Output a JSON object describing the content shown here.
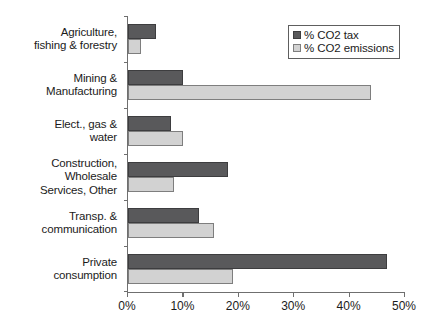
{
  "chart_data": {
    "type": "bar",
    "orientation": "horizontal",
    "title": "",
    "xlabel": "",
    "ylabel": "",
    "xlim": [
      0,
      50
    ],
    "xticks": [
      0,
      10,
      20,
      30,
      40,
      50
    ],
    "xtick_labels": [
      "0%",
      "10%",
      "20%",
      "30%",
      "40%",
      "50%"
    ],
    "grid": false,
    "legend_position": "top-right",
    "categories": [
      "Agriculture,\nfishing & forestry",
      "Mining &\nManufacturing",
      "Elect., gas &\nwater",
      "Construction,\nWholesale\nServices, Other",
      "Transp. &\ncommunication",
      "Private\nconsumption"
    ],
    "series": [
      {
        "name": "% CO2 tax",
        "color": "#59595b",
        "values": [
          5.0,
          9.9,
          7.7,
          18.0,
          12.8,
          46.7
        ]
      },
      {
        "name": "% CO2 emissions",
        "color": "#d2d2d2",
        "values": [
          2.3,
          43.8,
          9.9,
          8.3,
          15.6,
          19.0
        ]
      }
    ]
  },
  "legend": {
    "items": [
      {
        "label": "% CO2 tax",
        "swatch": "dark-square-icon"
      },
      {
        "label": "% CO2 emissions",
        "swatch": "light-square-icon"
      }
    ]
  }
}
